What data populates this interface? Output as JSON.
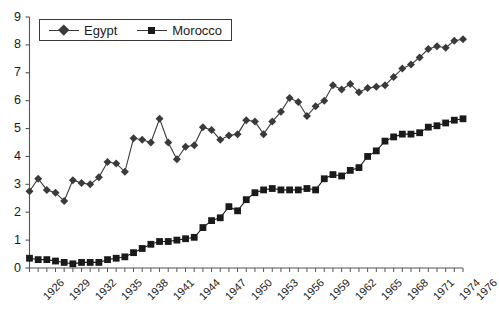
{
  "chart_data": {
    "type": "line",
    "title": "",
    "subtitle": "",
    "xlabel": "",
    "ylabel": "",
    "xlim": [
      1926,
      1976
    ],
    "ylim": [
      0,
      9
    ],
    "ytick_labels": [
      "0",
      "1",
      "2",
      "3",
      "4",
      "5",
      "6",
      "7",
      "8",
      "9"
    ],
    "ytick_values": [
      0,
      1,
      2,
      3,
      4,
      5,
      6,
      7,
      8,
      9
    ],
    "xtick_labels": [
      "1926",
      "1929",
      "1932",
      "1935",
      "1938",
      "1941",
      "1944",
      "1947",
      "1950",
      "1953",
      "1956",
      "1959",
      "1962",
      "1965",
      "1968",
      "1971",
      "1974",
      "1976"
    ],
    "xtick_values": [
      1926,
      1929,
      1932,
      1935,
      1938,
      1941,
      1944,
      1947,
      1950,
      1953,
      1956,
      1959,
      1962,
      1965,
      1968,
      1971,
      1974,
      1976
    ],
    "grid": false,
    "legend_position": "top-left",
    "x": [
      1926,
      1927,
      1928,
      1929,
      1930,
      1931,
      1932,
      1933,
      1934,
      1935,
      1936,
      1937,
      1938,
      1939,
      1940,
      1941,
      1942,
      1943,
      1944,
      1945,
      1946,
      1947,
      1948,
      1949,
      1950,
      1951,
      1952,
      1953,
      1954,
      1955,
      1956,
      1957,
      1958,
      1959,
      1960,
      1961,
      1962,
      1963,
      1964,
      1965,
      1966,
      1967,
      1968,
      1969,
      1970,
      1971,
      1972,
      1973,
      1974,
      1975,
      1976
    ],
    "series": [
      {
        "name": "Egypt",
        "marker": "diamond",
        "color": "#3a3a3a",
        "values": [
          2.75,
          3.2,
          2.8,
          2.7,
          2.4,
          3.15,
          3.05,
          3.0,
          3.25,
          3.8,
          3.75,
          3.45,
          4.65,
          4.6,
          4.5,
          5.35,
          4.5,
          3.9,
          4.35,
          4.4,
          5.05,
          4.95,
          4.6,
          4.75,
          4.8,
          5.3,
          5.25,
          4.8,
          5.25,
          5.6,
          6.1,
          5.95,
          5.45,
          5.8,
          6.0,
          6.55,
          6.4,
          6.6,
          6.3,
          6.45,
          6.5,
          6.55,
          6.85,
          7.15,
          7.3,
          7.55,
          7.85,
          7.95,
          7.9,
          8.15,
          8.2
        ]
      },
      {
        "name": "Morocco",
        "marker": "square",
        "color": "#1a1a1a",
        "values": [
          0.35,
          0.3,
          0.3,
          0.25,
          0.2,
          0.15,
          0.2,
          0.2,
          0.2,
          0.3,
          0.35,
          0.4,
          0.55,
          0.7,
          0.85,
          0.95,
          0.95,
          1.0,
          1.05,
          1.1,
          1.45,
          1.7,
          1.8,
          2.2,
          2.05,
          2.45,
          2.7,
          2.8,
          2.85,
          2.8,
          2.8,
          2.8,
          2.85,
          2.8,
          3.2,
          3.35,
          3.3,
          3.5,
          3.6,
          4.0,
          4.2,
          4.55,
          4.7,
          4.8,
          4.8,
          4.85,
          5.05,
          5.1,
          5.2,
          5.3,
          5.35
        ]
      }
    ]
  },
  "legend": {
    "items": [
      {
        "label": "Egypt",
        "marker": "diamond"
      },
      {
        "label": "Morocco",
        "marker": "square"
      }
    ]
  }
}
